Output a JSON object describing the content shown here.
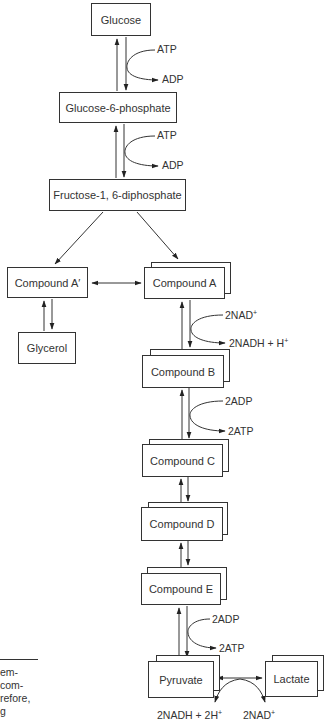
{
  "diagram": {
    "type": "metabolic pathway (glycolysis)",
    "nodes": {
      "glucose": "Glucose",
      "g6p": "Glucose-6-phosphate",
      "f16dp": "Fructose-1, 6-diphosphate",
      "compound_a_prime": "Compound A′",
      "compound_a": "Compound A",
      "glycerol": "Glycerol",
      "compound_b": "Compound B",
      "compound_c": "Compound C",
      "compound_d": "Compound D",
      "compound_e": "Compound E",
      "pyruvate": "Pyruvate",
      "lactate": "Lactate"
    },
    "cofactors": {
      "step1_in": "ATP",
      "step1_out": "ADP",
      "step2_in": "ATP",
      "step2_out": "ADP",
      "a_to_b_in": "2NAD",
      "a_to_b_in_sup": "+",
      "a_to_b_out": "2NADH + H",
      "a_to_b_out_sup": "+",
      "b_to_c_in": "2ADP",
      "b_to_c_out": "2ATP",
      "e_to_pyr_in": "2ADP",
      "e_to_pyr_out": "2ATP",
      "pyr_lac_left": "2NADH + 2H",
      "pyr_lac_left_sup": "+",
      "pyr_lac_right": "2NAD",
      "pyr_lac_right_sup": "+"
    },
    "edges": [
      {
        "from": "Glucose",
        "to": "Glucose-6-phosphate",
        "bidirectional": true,
        "cofactor_in": "ATP",
        "cofactor_out": "ADP"
      },
      {
        "from": "Glucose-6-phosphate",
        "to": "Fructose-1, 6-diphosphate",
        "bidirectional": true,
        "cofactor_in": "ATP",
        "cofactor_out": "ADP"
      },
      {
        "from": "Fructose-1, 6-diphosphate",
        "to": "Compound A′",
        "bidirectional": false
      },
      {
        "from": "Fructose-1, 6-diphosphate",
        "to": "Compound A",
        "bidirectional": false
      },
      {
        "from": "Compound A′",
        "to": "Compound A",
        "bidirectional": true
      },
      {
        "from": "Compound A′",
        "to": "Glycerol",
        "bidirectional": true
      },
      {
        "from": "Compound A",
        "to": "Compound B",
        "bidirectional": true,
        "cofactor_in": "2NAD+",
        "cofactor_out": "2NADH + H+"
      },
      {
        "from": "Compound B",
        "to": "Compound C",
        "bidirectional": true,
        "cofactor_in": "2ADP",
        "cofactor_out": "2ATP"
      },
      {
        "from": "Compound C",
        "to": "Compound D",
        "bidirectional": true
      },
      {
        "from": "Compound D",
        "to": "Compound E",
        "bidirectional": true
      },
      {
        "from": "Compound E",
        "to": "Pyruvate",
        "bidirectional": true,
        "cofactor_in": "2ADP",
        "cofactor_out": "2ATP"
      },
      {
        "from": "Pyruvate",
        "to": "Lactate",
        "bidirectional": true,
        "cofactors": [
          "2NADH + 2H+",
          "2NAD+"
        ]
      }
    ]
  },
  "side_text_fragment": {
    "lines": [
      "em-",
      "com-",
      "refore,",
      "g"
    ]
  }
}
